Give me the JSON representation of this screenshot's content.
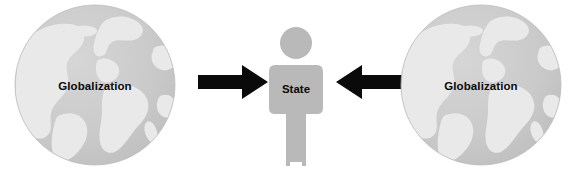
{
  "diagram": {
    "type": "conceptual-pressure-diagram",
    "canvas": {
      "width": 577,
      "height": 182,
      "background": "#ffffff"
    },
    "colors": {
      "globe_ocean": "#c9c9c9",
      "globe_land": "#e8e8e8",
      "figure_fill": "#b8b8b8",
      "arrow": "#0a0a0a",
      "label_text": "#0a0a0a"
    },
    "nodes": [
      {
        "id": "globe-left",
        "label": "Globalization",
        "shape": "globe-icon"
      },
      {
        "id": "state",
        "label": "State",
        "shape": "person-icon"
      },
      {
        "id": "globe-right",
        "label": "Globalization",
        "shape": "globe-icon"
      }
    ],
    "arrows": [
      {
        "id": "arrow-left",
        "direction": "right",
        "from": "globe-left",
        "to": "state"
      },
      {
        "id": "arrow-right",
        "direction": "left",
        "from": "globe-right",
        "to": "state"
      }
    ]
  }
}
